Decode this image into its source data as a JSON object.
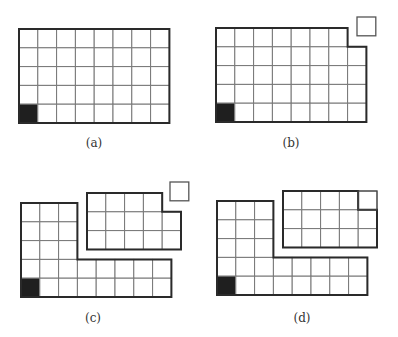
{
  "figure": {
    "colors": {
      "cell_fill": "#ffffff",
      "marked_cell_fill": "#1f1f1f",
      "outline": "#2a2a2a",
      "grid_line": "#777777"
    },
    "panels": [
      {
        "id": "a",
        "label": "(a)",
        "shapes": [
          {
            "kind": "rectangle-grid",
            "columns": 8,
            "rows": 5,
            "missing_cells": [],
            "marked_cell": "bottom-left"
          }
        ],
        "floating_cells": 0
      },
      {
        "id": "b",
        "label": "(b)",
        "shapes": [
          {
            "kind": "rectangle-grid",
            "columns": 8,
            "rows": 5,
            "missing_cells": [
              "top-right"
            ],
            "marked_cell": "bottom-left"
          }
        ],
        "floating_cells": 1
      },
      {
        "id": "c",
        "label": "(c)",
        "shapes": [
          {
            "kind": "L-shape",
            "vertical_arm": {
              "columns": 3,
              "rows": 3
            },
            "horizontal_arm": {
              "columns": 8,
              "rows": 2
            },
            "marked_cell": "bottom-left"
          },
          {
            "kind": "rectangle-grid",
            "columns": 5,
            "rows": 3,
            "missing_cells": [
              "top-right"
            ]
          }
        ],
        "floating_cells": 1
      },
      {
        "id": "d",
        "label": "(d)",
        "shapes": [
          {
            "kind": "L-shape",
            "vertical_arm": {
              "columns": 3,
              "rows": 3
            },
            "horizontal_arm": {
              "columns": 8,
              "rows": 2
            },
            "marked_cell": "bottom-left"
          },
          {
            "kind": "rectangle-grid",
            "columns": 5,
            "rows": 3,
            "missing_cells": [],
            "inserted_cell": "top-right"
          }
        ],
        "floating_cells": 0
      }
    ]
  }
}
